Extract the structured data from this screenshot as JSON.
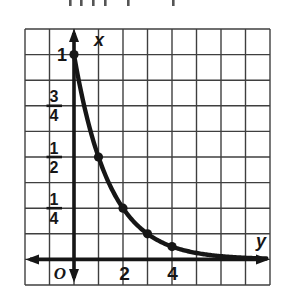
{
  "chart_data": {
    "type": "line",
    "title": "",
    "curve_model": "exponential decay, x = (1/2)^y",
    "decay_base": 0.5,
    "vertical_axis_label": "x",
    "horizontal_axis_label": "y",
    "origin_label": "O",
    "points": [
      {
        "y": 0,
        "x": 1,
        "x_label": "1"
      },
      {
        "y": 1,
        "x": 0.5,
        "x_label": "1/2"
      },
      {
        "y": 2,
        "x": 0.25,
        "x_label": "1/4"
      },
      {
        "y": 3,
        "x": 0.125,
        "x_label": "1/8"
      },
      {
        "y": 4,
        "x": 0.0625,
        "x_label": "1/16"
      }
    ],
    "vertical_ticks": [
      {
        "label": "1",
        "value": 1
      },
      {
        "label": "3/4",
        "num": "3",
        "den": "4",
        "value": 0.75
      },
      {
        "label": "1/2",
        "num": "1",
        "den": "2",
        "value": 0.5
      },
      {
        "label": "1/4",
        "num": "1",
        "den": "4",
        "value": 0.25
      }
    ],
    "horizontal_ticks": [
      {
        "label": "2",
        "value": 2
      },
      {
        "label": "4",
        "value": 4
      }
    ],
    "grid": true,
    "grid_cells": {
      "cols": 10,
      "rows": 10
    },
    "horizontal_axis_range": [
      -2,
      8
    ],
    "vertical_axis_range": [
      -0.125,
      1.125
    ],
    "legend": "none"
  },
  "colors": {
    "ink": "#161616",
    "grid": "#3f3f3f",
    "background": "#ffffff",
    "artifact": "#555555"
  }
}
